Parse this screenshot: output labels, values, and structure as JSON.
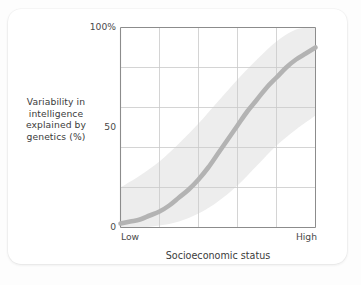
{
  "figure": {
    "background_color": "#ffffff",
    "card_radius_px": 13
  },
  "axes": {
    "y_tick_labels": [
      "100%",
      "50",
      "0"
    ],
    "y_tick_values": [
      100,
      50,
      0
    ],
    "x_tick_labels": [
      "Low",
      "High"
    ],
    "x_axis_title": "Socioeconomic status",
    "y_axis_title_lines": [
      "Variability in",
      "intelligence",
      "explained by",
      "genetics (%)"
    ],
    "axis_line_color": "#8c8c8c",
    "grid_color": "#c9c9c9"
  },
  "chart_data": {
    "type": "line",
    "title": "",
    "subtitle": "",
    "xlabel": "Socioeconomic status",
    "ylabel": "Variability in intelligence explained by genetics (%)",
    "xlim": [
      0,
      100
    ],
    "ylim": [
      0,
      100
    ],
    "xticklabels": [
      "Low",
      "High"
    ],
    "yticklabels": [
      "0",
      "50",
      "100%"
    ],
    "ytickvalues": [
      0,
      50,
      100
    ],
    "grid": true,
    "grid_columns": 5,
    "grid_rows": 5,
    "legend": "none",
    "series": [
      {
        "name": "Heritability estimate",
        "kind": "line",
        "color": "#b3b3b3",
        "line_width_px": 4.6,
        "x": [
          0,
          5,
          10,
          15,
          20,
          25,
          30,
          35,
          40,
          45,
          50,
          55,
          60,
          65,
          70,
          75,
          80,
          85,
          90,
          95,
          100
        ],
        "values": [
          2,
          3,
          4,
          6,
          8,
          11,
          15,
          19,
          24,
          30,
          37,
          44,
          51,
          58,
          64,
          70,
          75,
          80,
          84,
          87,
          90
        ]
      },
      {
        "name": "Uncertainty band upper bound",
        "kind": "band-upper",
        "color": "#ededed",
        "x": [
          0,
          10,
          20,
          30,
          40,
          50,
          60,
          70,
          80,
          90,
          100
        ],
        "values": [
          20,
          26,
          33,
          42,
          52,
          63,
          74,
          84,
          93,
          99,
          100
        ]
      },
      {
        "name": "Uncertainty band lower bound",
        "kind": "band-lower",
        "color": "#ededed",
        "x": [
          0,
          10,
          20,
          30,
          40,
          50,
          60,
          70,
          80,
          90,
          100
        ],
        "values": [
          0,
          0,
          1,
          3,
          7,
          13,
          21,
          31,
          41,
          49,
          56
        ]
      }
    ],
    "annotations": []
  }
}
